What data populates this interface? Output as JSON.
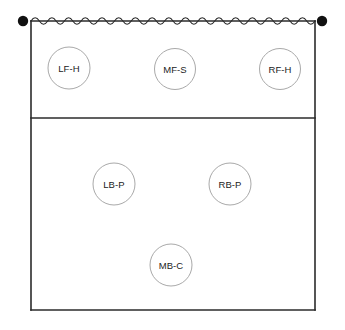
{
  "diagram": {
    "kind": "volleyball-court-formation",
    "canvas": {
      "width": 345,
      "height": 330
    },
    "colors": {
      "background": "#ffffff",
      "court_line": "#2b2b2b",
      "net_line": "#2b2b2b",
      "net_post": "#111111",
      "player_circle_stroke": "#a9a9a9",
      "player_circle_fill": "#ffffff",
      "player_label_text": "#222222"
    },
    "court": {
      "left": 31,
      "right": 315,
      "top": 21,
      "bottom": 310,
      "attack_line_y": 118,
      "line_width": 1.6
    },
    "net": {
      "y": 21,
      "left_x": 31,
      "right_x": 315,
      "wave_periods": 17,
      "wave_amplitude": 3.2,
      "post_radius": 5.2,
      "left_post": {
        "x": 23,
        "y": 21
      },
      "right_post": {
        "x": 322,
        "y": 21
      }
    },
    "players": [
      {
        "code": "LF-H",
        "position_name": "Left Front",
        "role_code": "H",
        "row": "front",
        "cx": 69,
        "cy": 68,
        "r": 21
      },
      {
        "code": "MF-S",
        "position_name": "Middle Front",
        "role_code": "S",
        "row": "front",
        "cx": 175,
        "cy": 69,
        "r": 20.5
      },
      {
        "code": "RF-H",
        "position_name": "Right Front",
        "role_code": "H",
        "row": "front",
        "cx": 280,
        "cy": 69,
        "r": 20.5
      },
      {
        "code": "LB-P",
        "position_name": "Left Back",
        "role_code": "P",
        "row": "back",
        "cx": 114,
        "cy": 184,
        "r": 21
      },
      {
        "code": "RB-P",
        "position_name": "Right Back",
        "role_code": "P",
        "row": "back",
        "cx": 230,
        "cy": 184,
        "r": 21
      },
      {
        "code": "MB-C",
        "position_name": "Middle Back",
        "role_code": "C",
        "row": "back",
        "cx": 171,
        "cy": 265,
        "r": 21
      }
    ]
  }
}
